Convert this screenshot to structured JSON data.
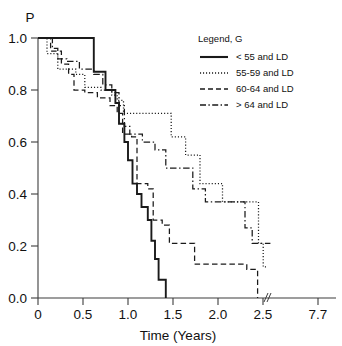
{
  "chart_data": {
    "type": "line",
    "title": "",
    "subtitle": "",
    "xlabel": "Time (Years)",
    "ylabel": "P",
    "xlim": [
      0,
      7.7
    ],
    "ylim": [
      0.0,
      1.0
    ],
    "grid": false,
    "axis_break": {
      "present": true,
      "symbol": "//",
      "after_tick": "2.5",
      "before_tick": "7.7"
    },
    "x_ticks": [
      "0",
      "0.5",
      "1.0",
      "1.5",
      "2.0",
      "2.5",
      "7.7"
    ],
    "x_tick_values": [
      0,
      0.5,
      1.0,
      1.5,
      2.0,
      2.5,
      7.7
    ],
    "y_ticks": [
      "0.0",
      "0.2",
      "0.4",
      "0.6",
      "0.8",
      "1.0"
    ],
    "y_tick_values": [
      0.0,
      0.2,
      0.4,
      0.6,
      0.8,
      1.0
    ],
    "legend": {
      "title": "Legend, G",
      "position": "top-right",
      "entries": [
        {
          "label": "< 55 and LD",
          "style": "solid"
        },
        {
          "label": "55-59 and LD",
          "style": "dotted"
        },
        {
          "label": "60-64 and LD",
          "style": "dashed"
        },
        {
          "label": "> 64 and LD",
          "style": "dash-dot"
        }
      ]
    },
    "series": [
      {
        "name": "< 55 and LD",
        "style": "solid",
        "steps": [
          [
            0.0,
            1.0
          ],
          [
            0.62,
            1.0
          ],
          [
            0.62,
            0.87
          ],
          [
            0.75,
            0.87
          ],
          [
            0.75,
            0.8
          ],
          [
            0.86,
            0.8
          ],
          [
            0.86,
            0.75
          ],
          [
            0.9,
            0.75
          ],
          [
            0.9,
            0.67
          ],
          [
            0.96,
            0.67
          ],
          [
            0.96,
            0.6
          ],
          [
            1.0,
            0.6
          ],
          [
            1.0,
            0.53
          ],
          [
            1.05,
            0.53
          ],
          [
            1.05,
            0.44
          ],
          [
            1.1,
            0.44
          ],
          [
            1.1,
            0.4
          ],
          [
            1.15,
            0.4
          ],
          [
            1.15,
            0.35
          ],
          [
            1.22,
            0.35
          ],
          [
            1.22,
            0.3
          ],
          [
            1.26,
            0.3
          ],
          [
            1.26,
            0.22
          ],
          [
            1.3,
            0.22
          ],
          [
            1.3,
            0.15
          ],
          [
            1.34,
            0.15
          ],
          [
            1.34,
            0.07
          ],
          [
            1.42,
            0.07
          ],
          [
            1.42,
            0.0
          ]
        ]
      },
      {
        "name": "55-59 and LD",
        "style": "dotted",
        "steps": [
          [
            0.0,
            1.0
          ],
          [
            0.1,
            1.0
          ],
          [
            0.1,
            0.94
          ],
          [
            0.22,
            0.94
          ],
          [
            0.22,
            0.88
          ],
          [
            0.42,
            0.88
          ],
          [
            0.42,
            0.86
          ],
          [
            0.52,
            0.86
          ],
          [
            0.52,
            0.81
          ],
          [
            0.7,
            0.81
          ],
          [
            0.7,
            0.8
          ],
          [
            0.82,
            0.8
          ],
          [
            0.82,
            0.78
          ],
          [
            0.88,
            0.78
          ],
          [
            0.88,
            0.76
          ],
          [
            0.95,
            0.76
          ],
          [
            0.95,
            0.71
          ],
          [
            1.48,
            0.71
          ],
          [
            1.48,
            0.62
          ],
          [
            1.64,
            0.62
          ],
          [
            1.64,
            0.55
          ],
          [
            1.8,
            0.55
          ],
          [
            1.8,
            0.44
          ],
          [
            2.05,
            0.44
          ],
          [
            2.05,
            0.37
          ],
          [
            2.45,
            0.37
          ],
          [
            2.45,
            0.21
          ],
          [
            2.52,
            0.21
          ],
          [
            2.52,
            0.12
          ],
          [
            2.85,
            0.12
          ]
        ]
      },
      {
        "name": "60-64 and LD",
        "style": "dashed",
        "steps": [
          [
            0.0,
            1.0
          ],
          [
            0.14,
            1.0
          ],
          [
            0.14,
            0.95
          ],
          [
            0.26,
            0.95
          ],
          [
            0.26,
            0.9
          ],
          [
            0.34,
            0.9
          ],
          [
            0.34,
            0.86
          ],
          [
            0.4,
            0.86
          ],
          [
            0.4,
            0.8
          ],
          [
            0.52,
            0.8
          ],
          [
            0.52,
            0.79
          ],
          [
            0.66,
            0.79
          ],
          [
            0.66,
            0.77
          ],
          [
            0.8,
            0.77
          ],
          [
            0.8,
            0.74
          ],
          [
            0.88,
            0.74
          ],
          [
            0.88,
            0.71
          ],
          [
            0.94,
            0.71
          ],
          [
            0.94,
            0.63
          ],
          [
            1.04,
            0.63
          ],
          [
            1.04,
            0.62
          ],
          [
            1.1,
            0.62
          ],
          [
            1.1,
            0.44
          ],
          [
            1.22,
            0.44
          ],
          [
            1.22,
            0.42
          ],
          [
            1.28,
            0.42
          ],
          [
            1.28,
            0.3
          ],
          [
            1.38,
            0.3
          ],
          [
            1.38,
            0.28
          ],
          [
            1.46,
            0.28
          ],
          [
            1.46,
            0.21
          ],
          [
            1.74,
            0.21
          ],
          [
            1.74,
            0.13
          ],
          [
            2.32,
            0.13
          ],
          [
            2.32,
            0.11
          ],
          [
            2.44,
            0.11
          ],
          [
            2.44,
            0.0
          ]
        ]
      },
      {
        "name": "> 64 and LD",
        "style": "dash-dot",
        "steps": [
          [
            0.0,
            1.0
          ],
          [
            0.16,
            1.0
          ],
          [
            0.16,
            0.96
          ],
          [
            0.22,
            0.96
          ],
          [
            0.22,
            0.92
          ],
          [
            0.32,
            0.92
          ],
          [
            0.32,
            0.91
          ],
          [
            0.46,
            0.91
          ],
          [
            0.46,
            0.88
          ],
          [
            0.62,
            0.88
          ],
          [
            0.62,
            0.86
          ],
          [
            0.72,
            0.86
          ],
          [
            0.72,
            0.82
          ],
          [
            0.82,
            0.82
          ],
          [
            0.82,
            0.79
          ],
          [
            0.9,
            0.79
          ],
          [
            0.9,
            0.74
          ],
          [
            0.96,
            0.74
          ],
          [
            0.96,
            0.66
          ],
          [
            1.02,
            0.66
          ],
          [
            1.02,
            0.63
          ],
          [
            1.16,
            0.63
          ],
          [
            1.16,
            0.6
          ],
          [
            1.3,
            0.6
          ],
          [
            1.3,
            0.57
          ],
          [
            1.42,
            0.57
          ],
          [
            1.42,
            0.5
          ],
          [
            1.72,
            0.5
          ],
          [
            1.72,
            0.42
          ],
          [
            1.86,
            0.42
          ],
          [
            1.86,
            0.37
          ],
          [
            2.3,
            0.37
          ],
          [
            2.3,
            0.27
          ],
          [
            2.38,
            0.27
          ],
          [
            2.38,
            0.21
          ],
          [
            3.2,
            0.21
          ]
        ]
      }
    ]
  }
}
